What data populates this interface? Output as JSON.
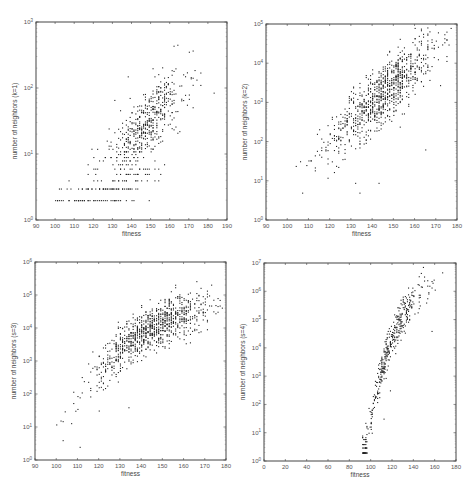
{
  "figure": {
    "width": 476,
    "height": 485,
    "background": "#ffffff",
    "point_color": "#222222",
    "frame_color": "#444444"
  },
  "chart_data": [
    {
      "type": "scatter",
      "id": "panel-k1",
      "title": "",
      "xlabel": "fitness",
      "ylabel": "number of neighbors (k=1)",
      "xlim": [
        90,
        190
      ],
      "xticks": [
        90,
        100,
        110,
        120,
        130,
        140,
        150,
        160,
        170,
        180,
        190
      ],
      "ylim_log10": [
        0,
        3
      ],
      "yticks": [
        "10^0",
        "10^1",
        "10^2",
        "10^3"
      ],
      "yscale": "log",
      "grid": false,
      "box_px": {
        "left": 36,
        "top": 22,
        "right": 227,
        "bottom": 220
      },
      "clusters": [
        {
          "n": 520,
          "x_mean": 148,
          "x_sd": 10,
          "slope": 0.028,
          "intercept_at": 140,
          "y_at": 1.25,
          "y_sd": 0.28,
          "y_min": 0.3,
          "quantize_low": true
        },
        {
          "n": 120,
          "x_mean": 128,
          "x_sd": 14,
          "slope": 0.01,
          "intercept_at": 128,
          "y_at": 0.48,
          "y_sd": 0.12,
          "y_min": 0.3,
          "quantize_low": true
        }
      ],
      "outliers": [
        [
          183,
          1.93
        ],
        [
          170,
          2.55
        ],
        [
          131,
          1.82
        ]
      ],
      "notes": "Discrete bands at low counts (2,3,4,...) from x≈99 to 165; dense cloud 135–165 reaching 10^2.5"
    },
    {
      "type": "scatter",
      "id": "panel-k2",
      "title": "",
      "xlabel": "fitness",
      "ylabel": "number of neighbors (k=2)",
      "xlim": [
        90,
        180
      ],
      "xticks": [
        90,
        100,
        110,
        120,
        130,
        140,
        150,
        160,
        170,
        180
      ],
      "ylim_log10": [
        0,
        5
      ],
      "yticks": [
        "10^0",
        "10^1",
        "10^2",
        "10^3",
        "10^4",
        "10^5"
      ],
      "yscale": "log",
      "grid": false,
      "box_px": {
        "left": 266,
        "top": 24,
        "right": 457,
        "bottom": 220
      },
      "clusters": [
        {
          "n": 900,
          "x_mean": 145,
          "x_sd": 13,
          "slope": 0.048,
          "intercept_at": 140,
          "y_at": 3.0,
          "y_sd": 0.38,
          "y_min": 0.3,
          "quantize_low": true
        }
      ],
      "outliers": [
        [
          143,
          0.95
        ],
        [
          134,
          0.7
        ],
        [
          165,
          1.8
        ],
        [
          132,
          0.95
        ]
      ],
      "notes": "Linear trend in log scale from ~10^0.3 at x=95 to ~10^4.4 at x=175"
    },
    {
      "type": "scatter",
      "id": "panel-k3",
      "title": "",
      "xlabel": "fitness",
      "ylabel": "number of neighbors (s=3)",
      "xlim": [
        90,
        180
      ],
      "xticks": [
        90,
        100,
        110,
        120,
        130,
        140,
        150,
        160,
        170,
        180
      ],
      "ylim_log10": [
        0,
        6
      ],
      "yticks": [
        "10^0",
        "10^1",
        "10^2",
        "10^3",
        "10^4",
        "10^5",
        "10^6"
      ],
      "yscale": "log",
      "grid": false,
      "box_px": {
        "left": 35,
        "top": 262,
        "right": 226,
        "bottom": 460
      },
      "clusters": [
        {
          "n": 950,
          "x_mean": 145,
          "x_sd": 14,
          "curve": "concave",
          "y_sd": 0.35,
          "y_min": 0.3,
          "quantize_low": true
        }
      ],
      "outliers": [
        [
          134,
          1.6
        ],
        [
          120,
          1.5
        ],
        [
          168,
          3.9
        ],
        [
          111,
          0.4
        ]
      ],
      "notes": "Concave rising trend: ~10^0.4 at x=95, ~10^3 at x=118, ~10^5 at x=165"
    },
    {
      "type": "scatter",
      "id": "panel-k4",
      "title": "",
      "xlabel": "fitness",
      "ylabel": "number of neighbors (s=4)",
      "xlim": [
        0,
        180
      ],
      "xticks": [
        0,
        20,
        40,
        60,
        80,
        100,
        120,
        140,
        160,
        180
      ],
      "ylim_log10": [
        0,
        7
      ],
      "yticks": [
        "10^0",
        "10^1",
        "10^2",
        "10^3",
        "10^4",
        "10^5",
        "10^6",
        "10^7"
      ],
      "yscale": "log",
      "grid": false,
      "box_px": {
        "left": 264,
        "top": 263,
        "right": 456,
        "bottom": 461
      },
      "clusters": [
        {
          "n": 420,
          "x_mean": 118,
          "x_sd": 17,
          "x_min": 92,
          "curve": "steep",
          "y_sd": 0.3,
          "y_min": 0.3,
          "quantize_low": true
        }
      ],
      "outliers": [
        [
          118,
          2.5
        ],
        [
          112,
          1.5
        ],
        [
          157,
          4.6
        ]
      ],
      "notes": "Steep concave rise: ~10^0.3 at x=95, ~10^3 at x=110, ~10^5.5 at x=140, ~10^6.3 at x=170"
    }
  ]
}
